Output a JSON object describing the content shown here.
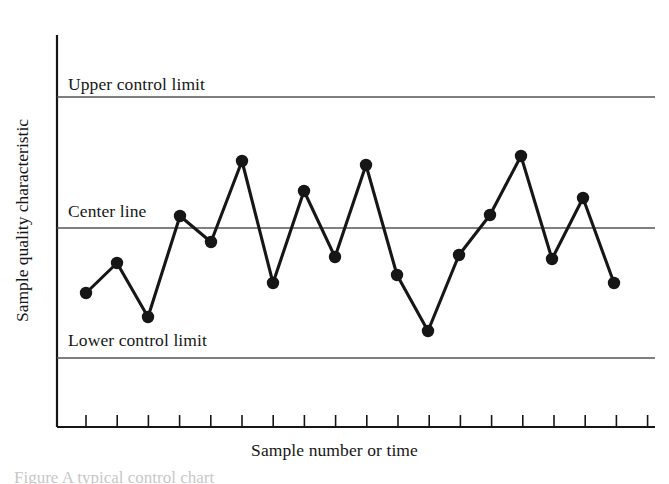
{
  "figure": {
    "background_color": "#ffffff",
    "ink_color": "#161616",
    "line_color": "#555555",
    "caption_fragment": "Figure  A typical control chart"
  },
  "annotations": {
    "upper_control_limit": "Upper control limit",
    "center_line": "Center line",
    "lower_control_limit": "Lower control limit"
  },
  "axes": {
    "xlabel": "Sample number or time",
    "ylabel": "Sample quality characteristic"
  },
  "chart_data": {
    "type": "line",
    "title": "",
    "subtitle": "",
    "xlabel": "Sample number or time",
    "ylabel": "Sample quality characteristic",
    "grid": false,
    "legend": "none",
    "x_tick_labels": [],
    "y_tick_labels": [],
    "xlim": [
      0.5,
      19.5
    ],
    "ylim": [
      0,
      10
    ],
    "x": [
      1,
      2,
      3,
      4,
      5,
      6,
      7,
      8,
      9,
      10,
      11,
      12,
      13,
      14,
      15,
      16,
      17,
      18,
      19
    ],
    "series": [
      {
        "name": "Sample quality characteristic",
        "marker": "filled-circle",
        "values": [
          3.25,
          4.1,
          2.55,
          5.3,
          4.55,
          6.85,
          3.55,
          6.15,
          4.3,
          6.75,
          3.85,
          2.25,
          2.35,
          4.15,
          5.25,
          7.0,
          4.2,
          5.85,
          3.5
        ]
      }
    ],
    "reference_lines": [
      {
        "name": "upper_control_limit",
        "label": "Upper control limit",
        "value": 9.05
      },
      {
        "name": "center_line",
        "label": "Center line",
        "value": 5.05
      },
      {
        "name": "lower_control_limit",
        "label": "Lower control limit",
        "value": 1.05
      }
    ]
  },
  "geometry": {
    "axis_x": 57,
    "axis_top": 35,
    "axis_bottom": 427,
    "axis_right": 655,
    "ucl_y": 97,
    "center_y": 228,
    "lcl_y": 358,
    "tick_start_x": 86,
    "tick_spacing": 31.2,
    "tick_count": 19,
    "tick_length": 12,
    "marker_radius": 6.2,
    "points": [
      [
        86,
        293
      ],
      [
        117,
        263
      ],
      [
        148,
        317
      ],
      [
        180,
        216
      ],
      [
        211,
        242
      ],
      [
        242,
        161
      ],
      [
        273,
        283
      ],
      [
        304,
        191
      ],
      [
        335,
        257
      ],
      [
        366,
        165
      ],
      [
        397,
        275
      ],
      [
        428,
        331
      ],
      [
        428,
        331
      ],
      [
        459,
        255
      ],
      [
        490,
        215
      ],
      [
        521,
        156
      ],
      [
        552,
        259
      ],
      [
        583,
        198
      ],
      [
        614,
        283
      ]
    ]
  }
}
